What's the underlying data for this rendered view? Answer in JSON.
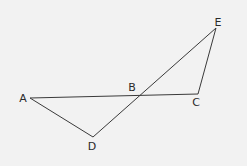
{
  "diagram": {
    "type": "geometry",
    "background": "#f2f2f2",
    "line_color": "#3a3a3a",
    "points": [
      {
        "id": "A",
        "label": "A",
        "x": 30,
        "y": 98,
        "lx": 23,
        "ly": 102
      },
      {
        "id": "B",
        "label": "B",
        "x": 140,
        "y": 96,
        "lx": 132,
        "ly": 91
      },
      {
        "id": "C",
        "label": "C",
        "x": 198,
        "y": 94,
        "lx": 196,
        "ly": 106
      },
      {
        "id": "D",
        "label": "D",
        "x": 93,
        "y": 137,
        "lx": 92,
        "ly": 150
      },
      {
        "id": "E",
        "label": "E",
        "x": 216,
        "y": 28,
        "lx": 218,
        "ly": 26
      }
    ],
    "segments": [
      {
        "from": "A",
        "to": "C"
      },
      {
        "from": "A",
        "to": "D"
      },
      {
        "from": "D",
        "to": "E"
      },
      {
        "from": "C",
        "to": "E"
      }
    ],
    "relations": [
      "B lies on segment AC",
      "B lies on segment DE",
      "Segments AC and DE intersect at B"
    ]
  }
}
